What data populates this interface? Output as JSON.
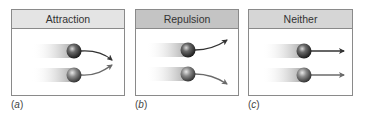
{
  "figure": {
    "panels": [
      {
        "id": "a",
        "title": "Attraction",
        "caption_open": "(",
        "caption_letter": "a",
        "caption_close": ")",
        "header_color": "#e4e4e4",
        "arrow_behavior": "curve-toward-each-other"
      },
      {
        "id": "b",
        "title": "Repulsion",
        "caption_open": "(",
        "caption_letter": "b",
        "caption_close": ")",
        "header_color": "#c4c4c4",
        "arrow_behavior": "curve-away-from-each-other"
      },
      {
        "id": "c",
        "title": "Neither",
        "caption_open": "(",
        "caption_letter": "c",
        "caption_close": ")",
        "header_color": "#d6d6d6",
        "arrow_behavior": "straight"
      }
    ],
    "icons": {
      "particle": "sphere-icon",
      "trail": "motion-trail",
      "path": "arrow-icon"
    },
    "colors": {
      "border": "#8a8a8a",
      "arrow_dark": "#333333",
      "arrow_light": "#666666",
      "sphere": "#3a3a3a",
      "sphere_light": "#6a6a6a"
    }
  }
}
